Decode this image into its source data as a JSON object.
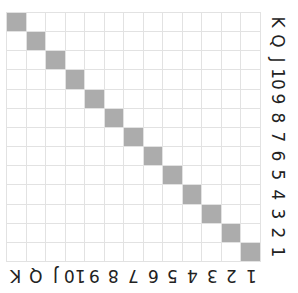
{
  "grid": {
    "rows": 13,
    "cols": 13,
    "filled_color": "#acacac",
    "line_color": "#e2e2e2",
    "filled_cells": "diagonal"
  },
  "right_labels": [
    "K",
    "Q",
    "J",
    "10",
    "9",
    "8",
    "7",
    "6",
    "5",
    "4",
    "3",
    "2",
    "1"
  ],
  "bottom_labels": [
    "K",
    "Q",
    "J",
    "10",
    "9",
    "8",
    "7",
    "6",
    "5",
    "4",
    "3",
    "2",
    "1"
  ]
}
